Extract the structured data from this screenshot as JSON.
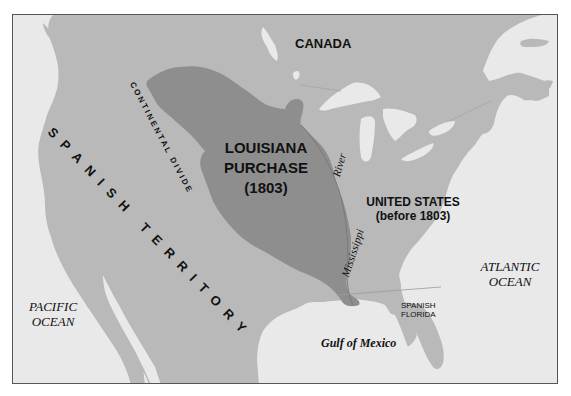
{
  "map": {
    "title": "Louisiana Purchase (1803)",
    "colors": {
      "water": "#e9e9e9",
      "land": "#b9b9b9",
      "louisiana": "#8e8e8e",
      "border": "#555555",
      "text": "#111111"
    },
    "labels": {
      "canada": "CANADA",
      "louisiana_line1": "LOUISIANA",
      "louisiana_line2": "PURCHASE",
      "louisiana_line3": "(1803)",
      "united_states_line1": "UNITED STATES",
      "united_states_line2": "(before 1803)",
      "spanish_territory": "SPANISH   TERRITORY",
      "continental_divide": "CONTINENTAL DIVIDE",
      "river": "River",
      "mississippi": "Mississippi",
      "pacific_line1": "PACIFIC",
      "pacific_line2": "OCEAN",
      "atlantic_line1": "ATLANTIC",
      "atlantic_line2": "OCEAN",
      "spanish_florida_line1": "SPANISH",
      "spanish_florida_line2": "FLORIDA",
      "gulf": "Gulf of Mexico"
    }
  }
}
